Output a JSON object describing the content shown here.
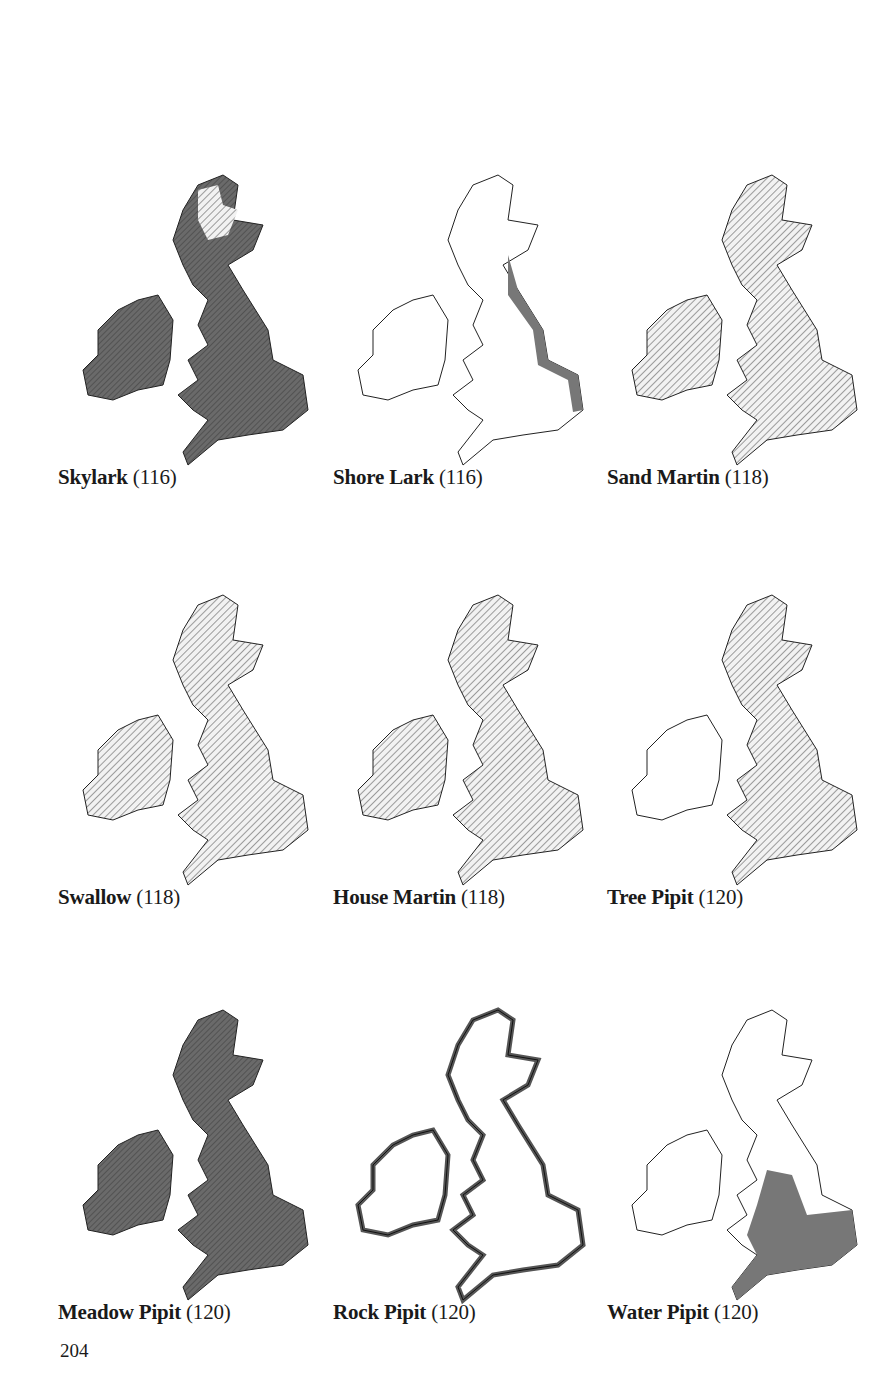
{
  "page": {
    "number": "204",
    "background": "#ffffff"
  },
  "legend_colors": {
    "dense": "#6a6a6a",
    "hatch": "#c8c8c8",
    "outline": "#222222",
    "empty": "#ffffff"
  },
  "maps": [
    {
      "name": "Skylark",
      "ref": "(116)",
      "style": "dense"
    },
    {
      "name": "Shore Lark",
      "ref": "(116)",
      "style": "coast-east"
    },
    {
      "name": "Sand Martin",
      "ref": "(118)",
      "style": "hatch"
    },
    {
      "name": "Swallow",
      "ref": "(118)",
      "style": "hatch"
    },
    {
      "name": "House Martin",
      "ref": "(118)",
      "style": "hatch"
    },
    {
      "name": "Tree Pipit",
      "ref": "(120)",
      "style": "hatch-gb"
    },
    {
      "name": "Meadow Pipit",
      "ref": "(120)",
      "style": "dense"
    },
    {
      "name": "Rock Pipit",
      "ref": "(120)",
      "style": "coast-all"
    },
    {
      "name": "Water Pipit",
      "ref": "(120)",
      "style": "south-east"
    }
  ]
}
